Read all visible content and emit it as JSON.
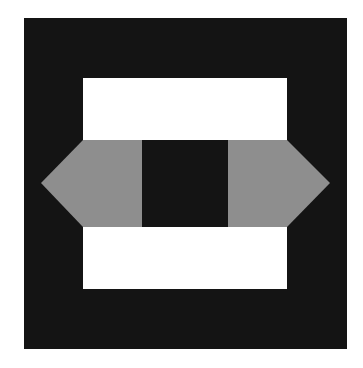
{
  "figure": {
    "colors": {
      "background": "#ffffff",
      "frame": "#141414",
      "white_panel": "#ffffff",
      "gray_band": "#8e8e8e",
      "center_square": "#141414"
    },
    "shapes": {
      "frame": {
        "x": 24,
        "y": 18,
        "w": 323,
        "h": 331
      },
      "top_panel": {
        "x": 83,
        "y": 78,
        "w": 204,
        "h": 62
      },
      "bottom_panel": {
        "x": 83,
        "y": 227,
        "w": 204,
        "h": 62
      },
      "gray_band_points": "83,140 287,140 330,183 287,227 83,227 41,183",
      "center_square": {
        "x": 142,
        "y": 140,
        "w": 86,
        "h": 87
      }
    }
  }
}
